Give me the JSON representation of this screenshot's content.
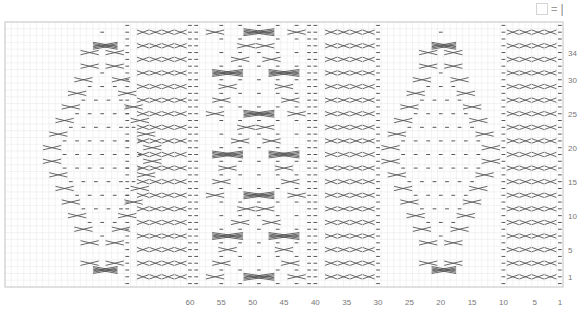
{
  "key": {
    "box_label": "",
    "equals": "=",
    "symbol": "|",
    "meaning": "knit"
  },
  "grid": {
    "columns": 89,
    "rows": 39,
    "left": 5,
    "top": 22,
    "right": 563,
    "bottom": 287,
    "line_color": "#e6e6e6",
    "border_color": "#c8c8c8",
    "symbol_color": "#555555"
  },
  "x_axis": {
    "ticks": [
      {
        "label": "60",
        "col": 60
      },
      {
        "label": "55",
        "col": 55
      },
      {
        "label": "50",
        "col": 50
      },
      {
        "label": "45",
        "col": 45
      },
      {
        "label": "40",
        "col": 40
      },
      {
        "label": "35",
        "col": 35
      },
      {
        "label": "30",
        "col": 30
      },
      {
        "label": "25",
        "col": 25
      },
      {
        "label": "20",
        "col": 20
      },
      {
        "label": "15",
        "col": 15
      },
      {
        "label": "10",
        "col": 10
      },
      {
        "label": "5",
        "col": 5
      },
      {
        "label": "1",
        "col": 1
      }
    ]
  },
  "y_axis": {
    "ticks": [
      {
        "label": "34",
        "row": 34
      },
      {
        "label": "30",
        "row": 30
      },
      {
        "label": "25",
        "row": 25
      },
      {
        "label": "20",
        "row": 20
      },
      {
        "label": "15",
        "row": 15
      },
      {
        "label": "10",
        "row": 10
      },
      {
        "label": "5",
        "row": 5
      },
      {
        "label": "1",
        "row": 1
      }
    ]
  },
  "panels": [
    {
      "name": "diamond-panel-left",
      "center_col": 74,
      "type": "diamond"
    },
    {
      "name": "rib-cable-panel-left",
      "from_col": 60,
      "to_col": 70,
      "type": "rib-cable"
    },
    {
      "name": "lattice-panel-center",
      "from_col": 41,
      "to_col": 59,
      "type": "lattice"
    },
    {
      "name": "rib-cable-panel-center",
      "from_col": 30,
      "to_col": 40,
      "type": "rib-cable"
    },
    {
      "name": "diamond-panel-right",
      "center_col": 20,
      "type": "diamond"
    },
    {
      "name": "rib-cable-panel-right",
      "from_col": 1,
      "to_col": 10,
      "type": "rib-cable"
    }
  ],
  "chart_data": {
    "type": "table",
    "xlabel": "stitch",
    "ylabel": "row",
    "x_range": [
      1,
      89
    ],
    "y_range": [
      0,
      38
    ],
    "legend": [
      {
        "symbol": "empty square",
        "meaning": "|"
      }
    ],
    "grid": true
  }
}
